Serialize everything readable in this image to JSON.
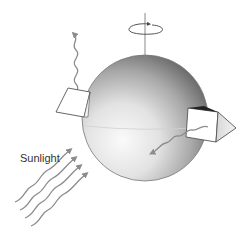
{
  "diagram": {
    "labels": {
      "sunlight": "Sunlight"
    },
    "elements": {
      "sphere": "planet-sphere",
      "axis": "rotation-axis",
      "rotation_arrow": "rotation-arrow",
      "left_panel": "surface-panel-left",
      "right_prism": "surface-prism-right",
      "emitted_wave_up": "emitted-radiation-up",
      "emitted_wave_down": "emitted-radiation-down",
      "incoming_waves": "incoming-sunlight-waves"
    },
    "colors": {
      "sphere_dark": "#5a5a5a",
      "sphere_light": "#f4f4f4",
      "wave": "#8c8c8c",
      "outline": "#555555",
      "text": "#333333"
    }
  }
}
